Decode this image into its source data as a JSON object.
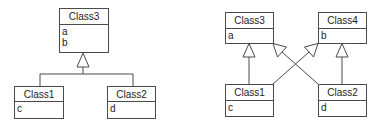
{
  "diagrams": [
    {
      "name": "single-inheritance",
      "classes": [
        {
          "id": "class3",
          "name": "Class3",
          "attributes": [
            "a",
            "b"
          ]
        },
        {
          "id": "class1",
          "name": "Class1",
          "attributes": [
            "c"
          ]
        },
        {
          "id": "class2",
          "name": "Class2",
          "attributes": [
            "d"
          ]
        }
      ],
      "relations": [
        {
          "type": "generalization",
          "from": "Class1",
          "to": "Class3"
        },
        {
          "type": "generalization",
          "from": "Class2",
          "to": "Class3"
        }
      ]
    },
    {
      "name": "multiple-inheritance",
      "classes": [
        {
          "id": "class3",
          "name": "Class3",
          "attributes": [
            "a"
          ]
        },
        {
          "id": "class4",
          "name": "Class4",
          "attributes": [
            "b"
          ]
        },
        {
          "id": "class1",
          "name": "Class1",
          "attributes": [
            "c"
          ]
        },
        {
          "id": "class2",
          "name": "Class2",
          "attributes": [
            "d"
          ]
        }
      ],
      "relations": [
        {
          "type": "generalization",
          "from": "Class1",
          "to": "Class3"
        },
        {
          "type": "generalization",
          "from": "Class1",
          "to": "Class4"
        },
        {
          "type": "generalization",
          "from": "Class2",
          "to": "Class3"
        },
        {
          "type": "generalization",
          "from": "Class2",
          "to": "Class4"
        }
      ]
    }
  ],
  "colors": {
    "stroke": "#4a4a4a",
    "text": "#222222",
    "background": "#ffffff"
  }
}
